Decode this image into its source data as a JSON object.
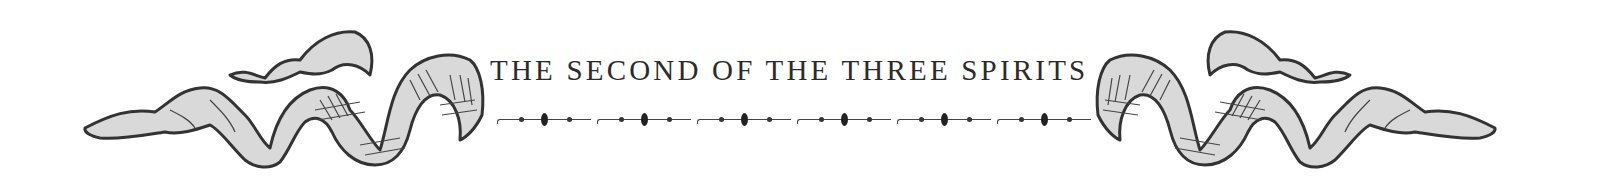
{
  "header": {
    "title": "THE SECOND OF THE THREE SPIRITS",
    "divider_segments": 6
  },
  "ornaments": {
    "left": "ribbon-ornament",
    "right": "ribbon-ornament",
    "fill": "#d9d9d9",
    "stroke": "#333333"
  },
  "colors": {
    "text": "#2b2b2b",
    "background": "#ffffff"
  }
}
